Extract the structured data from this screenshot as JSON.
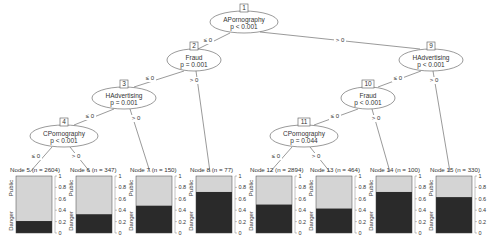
{
  "inner_nodes": [
    {
      "id": "1",
      "variable": "APornography",
      "p": "p < 0.001",
      "cx": 244,
      "cy": 22,
      "rx": 34,
      "ry": 11
    },
    {
      "id": "2",
      "variable": "Fraud",
      "p": "p = 0.001",
      "cx": 194,
      "cy": 60,
      "rx": 27,
      "ry": 11
    },
    {
      "id": "3",
      "variable": "HAdvertising",
      "p": "p = 0.001",
      "cx": 124,
      "cy": 98,
      "rx": 32,
      "ry": 11
    },
    {
      "id": "4",
      "variable": "CPornography",
      "p": "p < 0.001",
      "cx": 64,
      "cy": 136,
      "rx": 34,
      "ry": 11
    },
    {
      "id": "9",
      "variable": "HAdvertising",
      "p": "p < 0.001",
      "cx": 431,
      "cy": 60,
      "rx": 32,
      "ry": 11
    },
    {
      "id": "10",
      "variable": "Fraud",
      "p": "p < 0.001",
      "cx": 368,
      "cy": 98,
      "rx": 27,
      "ry": 11
    },
    {
      "id": "11",
      "variable": "CPornography",
      "p": "p = 0.044",
      "cx": 304,
      "cy": 136,
      "rx": 34,
      "ry": 11
    }
  ],
  "edges": [
    {
      "from": [
        230,
        33
      ],
      "to": [
        198,
        49
      ],
      "label": "≤ 0",
      "lx": 208,
      "ly": 42
    },
    {
      "from": [
        260,
        32
      ],
      "to": [
        420,
        49
      ],
      "label": "> 0",
      "lx": 340,
      "ly": 42
    },
    {
      "from": [
        184,
        71
      ],
      "to": [
        134,
        87
      ],
      "label": "≤ 0",
      "lx": 150,
      "ly": 80
    },
    {
      "from": [
        196,
        71
      ],
      "to": [
        210,
        172
      ],
      "label": "> 0",
      "lx": 194,
      "ly": 82
    },
    {
      "from": [
        114,
        109
      ],
      "to": [
        74,
        125
      ],
      "label": "≤ 0",
      "lx": 90,
      "ly": 118
    },
    {
      "from": [
        130,
        109
      ],
      "to": [
        150,
        172
      ],
      "label": "> 0",
      "lx": 136,
      "ly": 120
    },
    {
      "from": [
        52,
        147
      ],
      "to": [
        30,
        172
      ],
      "label": "≤ 0",
      "lx": 36,
      "ly": 158
    },
    {
      "from": [
        70,
        147
      ],
      "to": [
        90,
        172
      ],
      "label": "> 0",
      "lx": 76,
      "ly": 158
    },
    {
      "from": [
        421,
        71
      ],
      "to": [
        378,
        87
      ],
      "label": "≤ 0",
      "lx": 398,
      "ly": 80
    },
    {
      "from": [
        433,
        71
      ],
      "to": [
        450,
        172
      ],
      "label": "> 0",
      "lx": 434,
      "ly": 82
    },
    {
      "from": [
        358,
        109
      ],
      "to": [
        314,
        125
      ],
      "label": "≤ 0",
      "lx": 335,
      "ly": 118
    },
    {
      "from": [
        372,
        109
      ],
      "to": [
        390,
        172
      ],
      "label": "> 0",
      "lx": 376,
      "ly": 120
    },
    {
      "from": [
        292,
        147
      ],
      "to": [
        270,
        172
      ],
      "label": "≤ 0",
      "lx": 276,
      "ly": 158
    },
    {
      "from": [
        310,
        147
      ],
      "to": [
        330,
        172
      ],
      "label": "> 0",
      "lx": 316,
      "ly": 158
    }
  ],
  "terminal_nodes": [
    {
      "label": "Node 5 (n = 2604)",
      "danger": 0.21,
      "x": 8
    },
    {
      "label": "Node 6 (n = 347)",
      "danger": 0.33,
      "x": 68
    },
    {
      "label": "Node 7 (n = 150)",
      "danger": 0.48,
      "x": 128
    },
    {
      "label": "Node 8 (n = 77)",
      "danger": 0.72,
      "x": 188
    },
    {
      "label": "Node 12 (n = 2894)",
      "danger": 0.5,
      "x": 248
    },
    {
      "label": "Node 13 (n = 464)",
      "danger": 0.43,
      "x": 308
    },
    {
      "label": "Node 14 (n = 100)",
      "danger": 0.72,
      "x": 368
    },
    {
      "label": "Node 15 (n = 330)",
      "danger": 0.63,
      "x": 428
    }
  ],
  "bar_axis": {
    "ticks": [
      "0",
      "0.2",
      "0.4",
      "0.6",
      "0.8",
      "1"
    ],
    "top_class": "Public",
    "bottom_class": "Danger"
  },
  "colors": {
    "danger": "#2a2a2a",
    "public": "#d4d4d4",
    "line": "#555555",
    "text": "#333333"
  }
}
